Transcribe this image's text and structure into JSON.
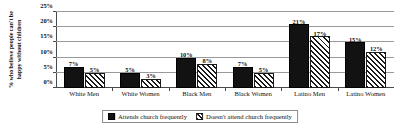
{
  "chart_data": {
    "type": "bar",
    "title": "",
    "xlabel": "",
    "ylabel_line1": "% who believe people can't be",
    "ylabel_line2": "happy without children",
    "categories": [
      "White Men",
      "White Women",
      "Black Men",
      "Black Women",
      "Latino Men",
      "Latino Women"
    ],
    "series": [
      {
        "name": "Attends church frequently",
        "pattern": "solid",
        "values": [
          7,
          5,
          10,
          7,
          21,
          15
        ],
        "value_labels": [
          "7%",
          "5%",
          "10%",
          "7%",
          "21%",
          "15%"
        ]
      },
      {
        "name": "Doesn't attend church frequently",
        "pattern": "diagonal-hatch",
        "values": [
          5,
          3,
          8,
          5,
          17,
          12
        ],
        "value_labels": [
          "5%",
          "3%",
          "8%",
          "5%",
          "17%",
          "12%"
        ]
      }
    ],
    "ylim": [
      0,
      25
    ],
    "yticks": [
      0,
      5,
      10,
      15,
      20,
      25
    ],
    "ytick_labels": [
      "0%",
      "5%",
      "10%",
      "15%",
      "20%",
      "25%"
    ],
    "grid": true,
    "grid_axis": "y",
    "legend_position": "bottom-center",
    "colors": {
      "series_1": "#121212",
      "series_2_hatch": "#1a1a1a",
      "series_2_background": "#ffffff",
      "gridline": "#9a9a9a",
      "axis": "#4a4a4a",
      "text": "#111111",
      "background": "#ffffff"
    }
  }
}
